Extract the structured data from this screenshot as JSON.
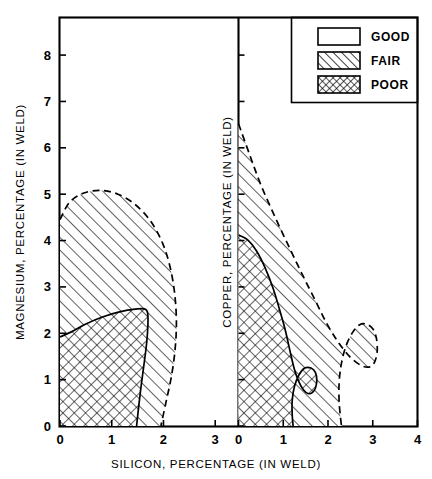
{
  "chart_data": {
    "type": "area",
    "title": "",
    "xlabel": "SILICON, PERCENTAGE (IN WELD)",
    "ylabel_left": "MAGNESIUM, PERCENTAGE (IN WELD)",
    "ylabel_right": "COPPER, PERCENTAGE (IN WELD)",
    "grid": false,
    "legend_position": "top-right",
    "panels": [
      {
        "name": "magnesium-panel",
        "y_axis_label": "MAGNESIUM, PERCENTAGE (IN WELD)",
        "x_ticks": [
          0,
          1,
          2,
          3
        ],
        "x_tick_labels": [
          "0",
          "1",
          "2",
          "3"
        ],
        "y_ticks": [
          0,
          1,
          2,
          3,
          4,
          5,
          6,
          7,
          8
        ],
        "y_tick_labels": [
          "0",
          "1",
          "2",
          "3",
          "4",
          "5",
          "6",
          "7",
          "8"
        ],
        "xlim": [
          0,
          3.45
        ],
        "ylim": [
          0,
          8.8
        ],
        "regions": [
          {
            "label": "FAIR",
            "pattern": "diagonal-hatch",
            "boundary_style": "dashed",
            "boundary_points": [
              [
                0.0,
                4.45
              ],
              [
                0.18,
                4.82
              ],
              [
                0.45,
                5.02
              ],
              [
                0.78,
                5.08
              ],
              [
                1.12,
                5.0
              ],
              [
                1.45,
                4.78
              ],
              [
                1.75,
                4.42
              ],
              [
                1.98,
                3.95
              ],
              [
                2.13,
                3.42
              ],
              [
                2.22,
                2.82
              ],
              [
                2.25,
                2.2
              ],
              [
                2.22,
                1.6
              ],
              [
                2.15,
                1.05
              ],
              [
                2.05,
                0.52
              ],
              [
                1.95,
                0.0
              ]
            ]
          },
          {
            "label": "POOR",
            "pattern": "cross-hatch",
            "boundary_style": "solid",
            "boundary_points": [
              [
                0.0,
                1.92
              ],
              [
                0.22,
                2.03
              ],
              [
                0.5,
                2.2
              ],
              [
                0.82,
                2.35
              ],
              [
                1.15,
                2.46
              ],
              [
                1.45,
                2.52
              ],
              [
                1.65,
                2.52
              ],
              [
                1.7,
                2.35
              ],
              [
                1.68,
                1.85
              ],
              [
                1.62,
                1.3
              ],
              [
                1.55,
                0.7
              ],
              [
                1.48,
                0.0
              ]
            ]
          }
        ]
      },
      {
        "name": "copper-panel",
        "y_axis_label": "COPPER, PERCENTAGE (IN WELD)",
        "x_ticks": [
          0,
          1,
          2,
          3,
          4
        ],
        "x_tick_labels": [
          "0",
          "1",
          "2",
          "3",
          "4"
        ],
        "y_ticks": [
          0,
          1,
          2,
          3,
          4,
          5,
          6,
          7,
          8
        ],
        "y_tick_labels": [
          "0",
          "1",
          "2",
          "3",
          "4",
          "5",
          "6",
          "7",
          "8"
        ],
        "xlim": [
          0,
          4.0
        ],
        "ylim": [
          0,
          8.8
        ],
        "regions": [
          {
            "label": "FAIR",
            "pattern": "diagonal-hatch",
            "boundary_style": "dashed",
            "boundary_points": [
              [
                0.0,
                6.52
              ],
              [
                0.25,
                5.85
              ],
              [
                0.5,
                5.2
              ],
              [
                0.82,
                4.5
              ],
              [
                1.15,
                3.82
              ],
              [
                1.45,
                3.22
              ],
              [
                1.72,
                2.7
              ],
              [
                1.95,
                2.25
              ],
              [
                2.2,
                1.85
              ],
              [
                2.48,
                1.5
              ],
              [
                2.75,
                1.3
              ],
              [
                2.95,
                1.28
              ],
              [
                3.05,
                1.4
              ],
              [
                3.1,
                1.62
              ],
              [
                3.08,
                1.9
              ],
              [
                3.0,
                2.1
              ],
              [
                2.85,
                2.2
              ],
              [
                2.7,
                2.18
              ],
              [
                2.55,
                2.02
              ],
              [
                2.4,
                1.72
              ],
              [
                2.3,
                1.35
              ],
              [
                2.25,
                0.95
              ],
              [
                2.25,
                0.5
              ],
              [
                2.3,
                0.0
              ]
            ]
          },
          {
            "label": "POOR",
            "pattern": "cross-hatch",
            "boundary_style": "solid",
            "boundary_points": [
              [
                0.0,
                4.12
              ],
              [
                0.2,
                4.02
              ],
              [
                0.4,
                3.78
              ],
              [
                0.6,
                3.4
              ],
              [
                0.78,
                2.95
              ],
              [
                0.92,
                2.5
              ],
              [
                1.05,
                2.05
              ],
              [
                1.15,
                1.62
              ],
              [
                1.25,
                1.22
              ],
              [
                1.35,
                0.95
              ],
              [
                1.45,
                0.78
              ],
              [
                1.55,
                0.7
              ],
              [
                1.65,
                0.72
              ],
              [
                1.72,
                0.82
              ],
              [
                1.75,
                0.98
              ],
              [
                1.72,
                1.15
              ],
              [
                1.62,
                1.25
              ],
              [
                1.48,
                1.25
              ],
              [
                1.35,
                1.1
              ],
              [
                1.25,
                0.85
              ],
              [
                1.2,
                0.55
              ],
              [
                1.2,
                0.25
              ],
              [
                1.22,
                0.0
              ]
            ]
          }
        ]
      }
    ],
    "legend": {
      "entries": [
        {
          "label": "GOOD",
          "pattern": "none"
        },
        {
          "label": "FAIR",
          "pattern": "diagonal-hatch"
        },
        {
          "label": "POOR",
          "pattern": "cross-hatch"
        }
      ]
    }
  },
  "axes": {
    "x_title": "SILICON, PERCENTAGE (IN WELD)",
    "y_left_title": "MAGNESIUM, PERCENTAGE (IN WELD)",
    "y_center_title": "COPPER, PERCENTAGE (IN WELD)",
    "y_left_tick_labels": [
      "0",
      "1",
      "2",
      "3",
      "4",
      "5",
      "6",
      "7",
      "8"
    ],
    "x_left_tick_labels": [
      "0",
      "1",
      "2",
      "3"
    ],
    "x_right_tick_labels": [
      "0",
      "1",
      "2",
      "3",
      "4"
    ]
  },
  "legend": {
    "good_label": "GOOD",
    "fair_label": "FAIR",
    "poor_label": "POOR"
  },
  "colors": {
    "ink": "#000000",
    "background": "#ffffff"
  }
}
